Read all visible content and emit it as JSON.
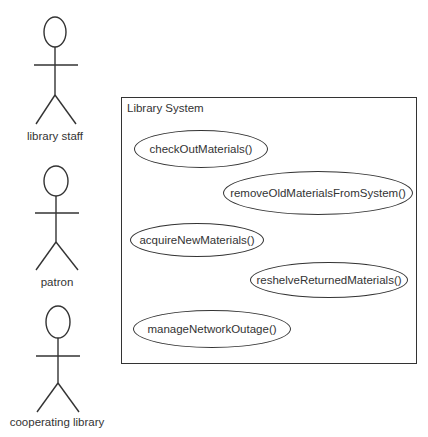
{
  "actors": [
    {
      "label": "library staff"
    },
    {
      "label": "patron"
    },
    {
      "label": "cooperating library"
    }
  ],
  "system": {
    "title": "Library System",
    "use_cases": [
      {
        "label": "checkOutMaterials()"
      },
      {
        "label": "removeOldMaterialsFromSystem()"
      },
      {
        "label": "acquireNewMaterials()"
      },
      {
        "label": "reshelveReturnedMaterials()"
      },
      {
        "label": "manageNetworkOutage()"
      }
    ]
  },
  "colors": {
    "stroke": "#333333",
    "background": "#ffffff"
  }
}
